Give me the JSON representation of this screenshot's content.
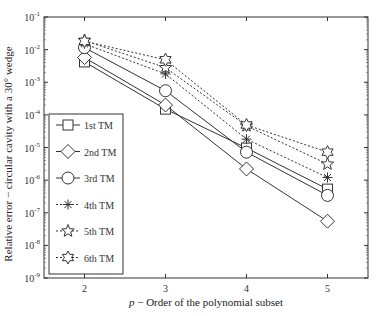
{
  "chart_data": {
    "type": "line",
    "title": "",
    "xlabel_var": "p",
    "xlabel": "p − Order of the polynomial subset",
    "ylabel": "Relative error − circular cavity with a 30° wedge",
    "yscale": "log",
    "ylim": [
      1e-09,
      0.1
    ],
    "xlim": [
      1.5,
      5.5
    ],
    "x": [
      2,
      3,
      4,
      5
    ],
    "xticks": [
      "2",
      "3",
      "4",
      "5"
    ],
    "yticks": [
      "10^-1",
      "10^-2",
      "10^-3",
      "10^-4",
      "10^-5",
      "10^-6",
      "10^-7",
      "10^-8",
      "10^-9"
    ],
    "grid": false,
    "legend_position": "lower left",
    "series": [
      {
        "name": "1st TM",
        "marker": "square",
        "linestyle": "solid",
        "values": [
          0.0042,
          0.00015,
          9.6e-06,
          5.3e-07
        ]
      },
      {
        "name": "2nd TM",
        "marker": "diamond",
        "linestyle": "solid",
        "values": [
          0.0057,
          0.0002,
          2.2e-06,
          5.5e-08
        ]
      },
      {
        "name": "3rd TM",
        "marker": "circle",
        "linestyle": "solid",
        "values": [
          0.0115,
          0.00055,
          7.2e-06,
          3.4e-07
        ]
      },
      {
        "name": "4th TM",
        "marker": "asterisk",
        "linestyle": "dotted",
        "values": [
          0.015,
          0.0018,
          1.8e-05,
          1.2e-06
        ]
      },
      {
        "name": "5th TM",
        "marker": "star5",
        "linestyle": "dotted",
        "values": [
          0.019,
          0.0028,
          4.6e-05,
          3.1e-06
        ]
      },
      {
        "name": "6th TM",
        "marker": "hexagram",
        "linestyle": "dotted",
        "values": [
          0.018,
          0.0049,
          4.9e-05,
          7.2e-06
        ]
      }
    ]
  }
}
